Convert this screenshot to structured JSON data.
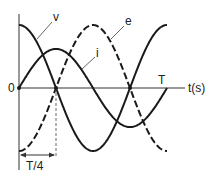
{
  "diagram": {
    "title": "",
    "axis": {
      "origin_label": "0",
      "x_label": "t(s)",
      "period_label": "T",
      "quarter_label": "T/4"
    },
    "curves": [
      {
        "name": "v",
        "label": "v",
        "function": "cos",
        "relative_amplitude": 1.0,
        "style": "solid"
      },
      {
        "name": "e",
        "label": "e",
        "function": "-cos",
        "relative_amplitude": 1.0,
        "style": "dashed"
      },
      {
        "name": "i",
        "label": "i",
        "function": "sin",
        "relative_amplitude": 0.62,
        "style": "solid"
      }
    ],
    "colors": {
      "line": "#1a1a1a",
      "background": "#ffffff"
    }
  }
}
